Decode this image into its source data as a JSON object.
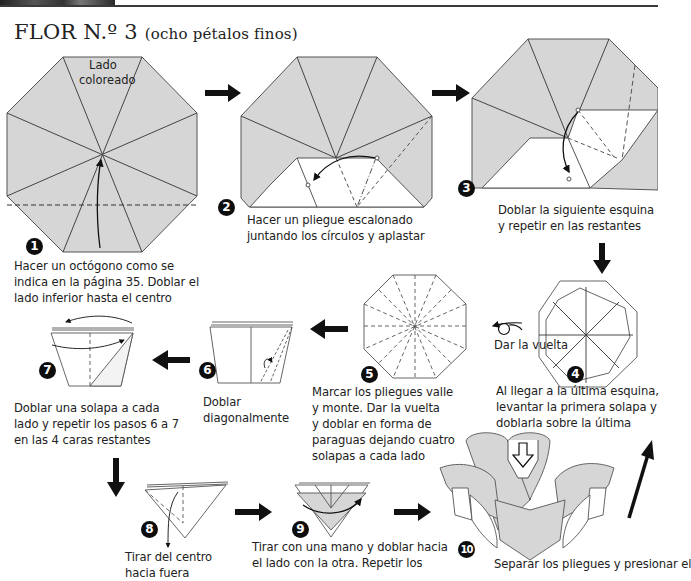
{
  "header": {
    "title": "FLOR N.º 3",
    "subtitle": "(ocho pétalos finos)"
  },
  "steps": [
    {
      "number": "1",
      "label_lines": [
        "Hacer un octógono como se",
        "indica en la página 35. Doblar el",
        "lado inferior hasta el centro"
      ],
      "diagram_label_lines": [
        "Lado",
        "coloreado"
      ]
    },
    {
      "number": "2",
      "label_lines": [
        "Hacer un pliegue escalonado",
        "juntando los círculos y aplastar"
      ]
    },
    {
      "number": "3",
      "label_lines": [
        "Doblar la siguiente esquina",
        "y repetir en las restantes"
      ]
    },
    {
      "number": "4",
      "label_lines": [
        "Al llegar a la última esquina,",
        "levantar la primera solapa y",
        "doblarla sobre la última"
      ],
      "side_note": "Dar la vuelta"
    },
    {
      "number": "5",
      "label_lines": [
        "Marcar los pliegues valle",
        "y monte. Dar la vuelta",
        "y doblar en forma de",
        "paraguas dejando cuatro",
        "solapas a cada lado"
      ]
    },
    {
      "number": "6",
      "label_lines": [
        "Doblar",
        "diagonalmente"
      ]
    },
    {
      "number": "7",
      "label_lines": [
        "Doblar una solapa a cada",
        "lado y repetir los pasos 6 a 7",
        "en las 4 caras restantes"
      ]
    },
    {
      "number": "8",
      "label_lines": [
        "Tirar del centro",
        "hacia fuera"
      ]
    },
    {
      "number": "9",
      "label_lines": [
        "Tirar con una mano y doblar hacia",
        "el lado con la otra. Repetir los"
      ]
    },
    {
      "number": "10",
      "label_lines": [
        "Separar los pliegues y presionar el"
      ]
    }
  ],
  "colors": {
    "paper_colored": "#d6d6d6",
    "paper_white": "#ffffff",
    "line": "#555555",
    "arrow": "#111111"
  }
}
